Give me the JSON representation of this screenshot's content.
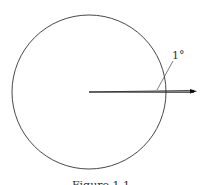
{
  "diagram": {
    "angle_label": "1°",
    "caption": "Figure 1.1",
    "circle": {
      "cx": 89,
      "cy": 92,
      "r": 77,
      "stroke": "#333333"
    },
    "arrow": {
      "x1": 89,
      "y1": 92,
      "x2": 196,
      "y2": 92,
      "stroke": "#111111"
    },
    "second_ray": {
      "x1": 89,
      "y1": 92,
      "x2": 194,
      "y2": 90
    }
  }
}
